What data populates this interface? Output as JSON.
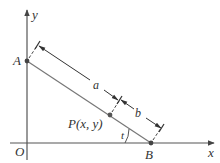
{
  "diagram": {
    "type": "geometry",
    "colors": {
      "axis": "#555555",
      "segment": "#777777",
      "dimension": "#444444",
      "point": "#444444",
      "text": "#333333"
    },
    "labels": {
      "x_axis": "x",
      "y_axis": "y",
      "origin": "O",
      "point_a": "A",
      "point_b": "B",
      "point_p": "P(x, y)",
      "length_a": "a",
      "length_b": "b",
      "angle": "t"
    },
    "points": {
      "O": [
        27,
        143
      ],
      "A": [
        27,
        61
      ],
      "B": [
        151,
        143
      ],
      "P": [
        110,
        115
      ]
    }
  }
}
